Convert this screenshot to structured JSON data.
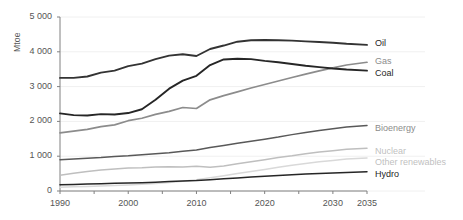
{
  "chart_data": {
    "type": "line",
    "title": "",
    "xlabel": "",
    "ylabel": "Mtoe",
    "xlim": [
      1990,
      2035
    ],
    "ylim": [
      0,
      5000
    ],
    "grid": true,
    "legend_position": "right",
    "ytick_labels": [
      "5 000",
      "4 000",
      "3 000",
      "2 000",
      "1 000",
      "0"
    ],
    "ytick_values": [
      5000,
      4000,
      3000,
      2000,
      1000,
      0
    ],
    "xtick_labels": [
      "1990",
      "2000",
      "2010",
      "2020",
      "2030",
      "2035"
    ],
    "xtick_values": [
      1990,
      2000,
      2010,
      2020,
      2030,
      2035
    ],
    "x": [
      1990,
      1992,
      1994,
      1996,
      1998,
      2000,
      2002,
      2004,
      2006,
      2008,
      2010,
      2012,
      2014,
      2016,
      2018,
      2020,
      2022,
      2024,
      2026,
      2028,
      2030,
      2032,
      2035
    ],
    "series": [
      {
        "name": "Oil",
        "color": "#333333",
        "width": 1.9,
        "values": [
          3250,
          3250,
          3290,
          3400,
          3460,
          3590,
          3660,
          3790,
          3890,
          3930,
          3880,
          4080,
          4180,
          4290,
          4330,
          4340,
          4330,
          4320,
          4300,
          4280,
          4260,
          4230,
          4200
        ]
      },
      {
        "name": "Gas",
        "color": "#8c8c8c",
        "width": 1.7,
        "values": [
          1670,
          1720,
          1770,
          1850,
          1900,
          2020,
          2090,
          2200,
          2290,
          2400,
          2370,
          2620,
          2740,
          2850,
          2960,
          3060,
          3160,
          3260,
          3360,
          3450,
          3540,
          3620,
          3700
        ]
      },
      {
        "name": "Coal",
        "color": "#262626",
        "width": 1.9,
        "values": [
          2230,
          2180,
          2170,
          2210,
          2200,
          2240,
          2350,
          2620,
          2940,
          3170,
          3310,
          3620,
          3780,
          3800,
          3790,
          3740,
          3700,
          3650,
          3600,
          3560,
          3520,
          3490,
          3460
        ]
      },
      {
        "name": "Bioenergy",
        "color": "#595959",
        "width": 1.5,
        "values": [
          900,
          920,
          940,
          960,
          990,
          1010,
          1040,
          1070,
          1100,
          1140,
          1180,
          1250,
          1310,
          1370,
          1430,
          1490,
          1550,
          1620,
          1680,
          1740,
          1790,
          1840,
          1880
        ]
      },
      {
        "name": "Nuclear",
        "color": "#bfbfbf",
        "width": 1.5,
        "values": [
          450,
          510,
          560,
          600,
          630,
          660,
          670,
          690,
          700,
          690,
          710,
          680,
          720,
          780,
          840,
          900,
          960,
          1010,
          1070,
          1120,
          1160,
          1200,
          1230
        ]
      },
      {
        "name": "Other renewables",
        "color": "#d9d9d9",
        "width": 1.5,
        "values": [
          110,
          120,
          130,
          145,
          160,
          175,
          195,
          215,
          245,
          280,
          320,
          380,
          440,
          500,
          560,
          620,
          680,
          740,
          790,
          840,
          880,
          920,
          950
        ]
      },
      {
        "name": "Hydro",
        "color": "#262626",
        "width": 1.5,
        "values": [
          180,
          190,
          200,
          210,
          220,
          230,
          240,
          255,
          270,
          285,
          300,
          325,
          350,
          375,
          400,
          425,
          445,
          465,
          485,
          505,
          520,
          535,
          550
        ]
      }
    ]
  },
  "legend": {
    "items": [
      {
        "label": "Oil",
        "top": 38,
        "tone": "lg-dark"
      },
      {
        "label": "Gas",
        "top": 56,
        "tone": "lg-mid"
      },
      {
        "label": "Coal",
        "top": 68,
        "tone": "lg-dark"
      },
      {
        "label": "Bioenergy",
        "top": 123,
        "tone": "lg-mid"
      },
      {
        "label": "Nuclear",
        "top": 146,
        "tone": "lg-light"
      },
      {
        "label": "Other renewables",
        "top": 157,
        "tone": "lg-light"
      },
      {
        "label": "Hydro",
        "top": 169,
        "tone": "lg-dark"
      }
    ]
  }
}
